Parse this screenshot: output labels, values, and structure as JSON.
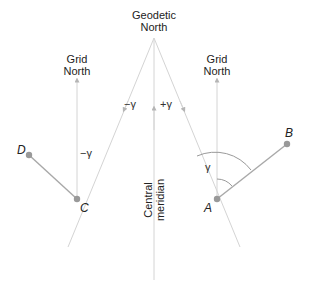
{
  "labels": {
    "geodetic_north": [
      "Geodetic",
      "North"
    ],
    "grid_north_left": [
      "Grid",
      "North"
    ],
    "grid_north_right": [
      "Grid",
      "North"
    ],
    "central_meridian": [
      "Central",
      "meridian"
    ],
    "minus_gamma_center": "−γ",
    "plus_gamma_center": "+γ",
    "minus_gamma_left": "−γ",
    "gamma_right": "γ"
  },
  "points": {
    "A": "A",
    "B": "B",
    "C": "C",
    "D": "D"
  },
  "colors": {
    "thin_line": "#d4d4d4",
    "segment": "#a8a8a8",
    "point": "#999999",
    "text": "#222222",
    "arc": "#9a9a9a"
  }
}
